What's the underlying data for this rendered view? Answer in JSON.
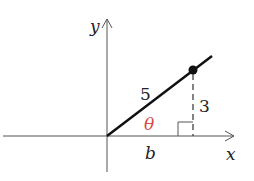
{
  "diagram": {
    "type": "right-triangle-on-coordinate-axes",
    "axes": {
      "x_label": "x",
      "y_label": "y"
    },
    "labels": {
      "hypotenuse": "5",
      "opposite": "3",
      "adjacent": "b",
      "angle": "θ"
    },
    "colors": {
      "stroke": "#222222",
      "angle": "#d94a4a",
      "axis": "#555555"
    }
  }
}
